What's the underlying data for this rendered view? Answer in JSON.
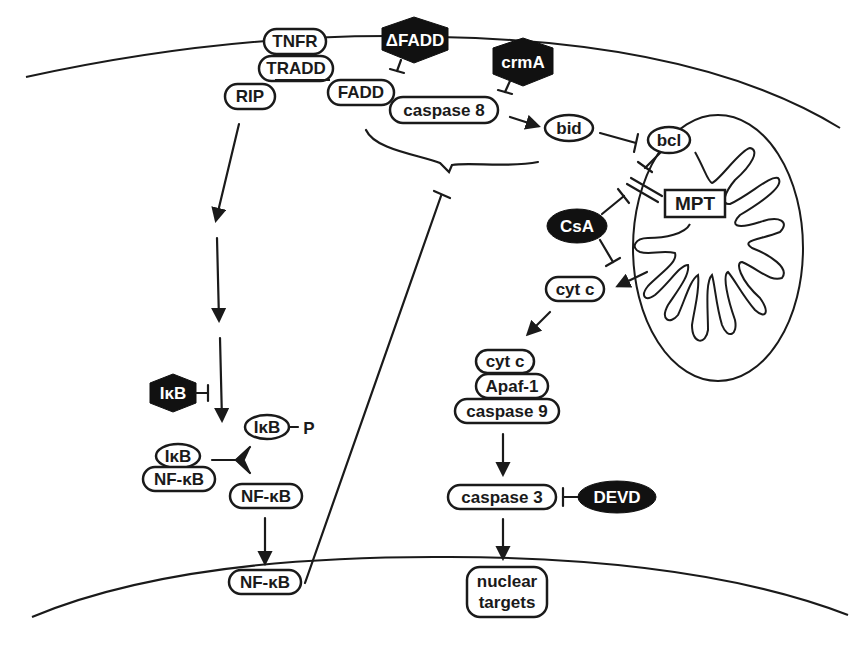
{
  "figure": {
    "type": "signaling pathway diagram",
    "compartments": [
      "plasma membrane",
      "mitochondrion",
      "nuclear membrane"
    ]
  },
  "nodes": {
    "tnfr": "TNFR",
    "tradd": "TRADD",
    "rip": "RIP",
    "fadd": "FADD",
    "caspase8": "caspase 8",
    "dfadd": "ΔFADD",
    "crma": "crmA",
    "bid": "bid",
    "bcl": "bcl",
    "mpt": "MPT",
    "csa": "CsA",
    "cytc_free": "cyt c",
    "cytc_complex": "cyt c",
    "apaf1": "Apaf-1",
    "caspase9": "caspase 9",
    "caspase3": "caspase 3",
    "devd": "DEVD",
    "nuclear_targets_line1": "nuclear",
    "nuclear_targets_line2": "targets",
    "ikb_inhibitor": "IκB",
    "ikb_p": "IκB",
    "phospho": "P",
    "ikb_complex": "IκB",
    "nfkb_complex": "NF-κB",
    "nfkb_free": "NF-κB",
    "nfkb_nuclear": "NF-κB"
  },
  "edges": [
    {
      "from": "RIP",
      "to": "signal cascade",
      "type": "activation"
    },
    {
      "from": "IκB (inhibitor)",
      "to": "signal cascade",
      "type": "inhibition"
    },
    {
      "from": "ΔFADD",
      "to": "FADD",
      "type": "inhibition"
    },
    {
      "from": "crmA",
      "to": "caspase 8",
      "type": "inhibition"
    },
    {
      "from": "caspase 8",
      "to": "bid",
      "type": "activation"
    },
    {
      "from": "bid",
      "to": "bcl",
      "type": "inhibition"
    },
    {
      "from": "bcl",
      "to": "MPT",
      "type": "inhibition"
    },
    {
      "from": "CsA",
      "to": "MPT",
      "type": "inhibition"
    },
    {
      "from": "CsA",
      "to": "cyt c release",
      "type": "inhibition"
    },
    {
      "from": "mitochondrion",
      "to": "cyt c",
      "type": "release"
    },
    {
      "from": "cyt c",
      "to": "cyt c/Apaf-1/caspase 9",
      "type": "activation"
    },
    {
      "from": "caspase 9 complex",
      "to": "caspase 3",
      "type": "activation"
    },
    {
      "from": "DEVD",
      "to": "caspase 3",
      "type": "inhibition"
    },
    {
      "from": "caspase 3",
      "to": "nuclear targets",
      "type": "activation"
    },
    {
      "from": "IκB/NF-κB",
      "to": "IκB-P + NF-κB",
      "type": "dissociation"
    },
    {
      "from": "NF-κB",
      "to": "NF-κB (nuclear)",
      "type": "translocation"
    },
    {
      "from": "NF-κB (nuclear)",
      "to": "FADD/caspase 8 complex",
      "type": "inhibition"
    }
  ],
  "colors": {
    "ink": "#1a1a1a",
    "inhibitor_fill": "#111111",
    "background": "#ffffff"
  }
}
